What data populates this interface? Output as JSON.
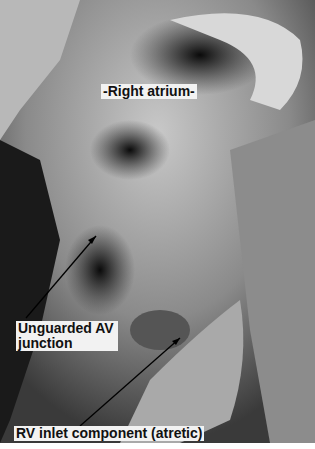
{
  "image": {
    "description": "Black-and-white photograph of a dissected heart specimen showing the right atrium and an atretic right ventricular inlet",
    "background": "#6a6a6a"
  },
  "labels": {
    "right_atrium": "-Right atrium-",
    "av_junction": "Unguarded AV junction",
    "rv_inlet": "RV inlet component (atretic)"
  },
  "arrows": [
    {
      "from": [
        26,
        318
      ],
      "to": [
        96,
        236
      ],
      "target": "av_junction"
    },
    {
      "from": [
        80,
        426
      ],
      "to": [
        180,
        338
      ],
      "target": "rv_inlet"
    }
  ]
}
